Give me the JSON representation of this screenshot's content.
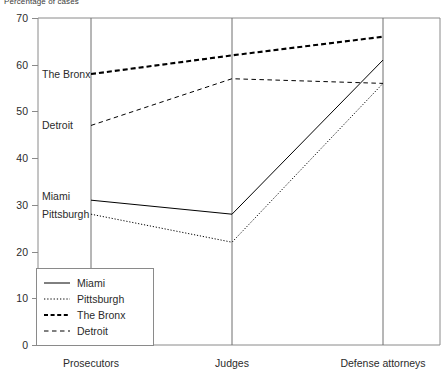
{
  "chart_data": {
    "type": "line",
    "title": "Percentage of cases",
    "ylabel": "Percentage of cases",
    "xlabel": "",
    "categories": [
      "Prosecutors",
      "Judges",
      "Defense attorneys"
    ],
    "ylim": [
      0,
      70
    ],
    "yticks": [
      0,
      10,
      20,
      30,
      40,
      50,
      60,
      70
    ],
    "grid": false,
    "legend_position": "bottom-left",
    "series": [
      {
        "name": "Miami",
        "style": "solid",
        "values": [
          31,
          28,
          61
        ]
      },
      {
        "name": "Pittsburgh",
        "style": "dotted",
        "values": [
          28,
          22,
          56
        ]
      },
      {
        "name": "The Bronx",
        "style": "bold-dashed",
        "values": [
          58,
          62,
          66
        ]
      },
      {
        "name": "Detroit",
        "style": "dashed",
        "values": [
          47,
          57,
          56
        ]
      }
    ],
    "inline_annotations": [
      {
        "text": "The Bronx",
        "value": 58
      },
      {
        "text": "Detroit",
        "value": 47
      },
      {
        "text": "Miami",
        "value": 32
      },
      {
        "text": "Pittsburgh",
        "value": 28
      }
    ]
  },
  "legend": {
    "items": [
      {
        "label": "Miami"
      },
      {
        "label": "Pittsburgh"
      },
      {
        "label": "The Bronx"
      },
      {
        "label": "Detroit"
      }
    ]
  },
  "colors": {
    "line": "#000000",
    "axis": "#8a8a8a",
    "text": "#2b2b2b",
    "background": "#ffffff"
  }
}
